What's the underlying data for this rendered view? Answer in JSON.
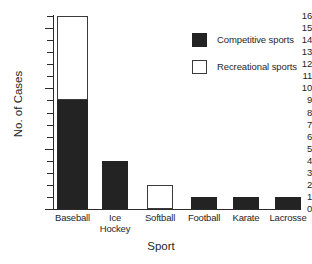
{
  "chart_data": {
    "type": "bar",
    "title": "",
    "xlabel": "Sport",
    "ylabel": "No. of Cases",
    "categories": [
      "Baseball",
      "Ice\nHockey",
      "Softball",
      "Football",
      "Karate",
      "Lacrosse"
    ],
    "series": [
      {
        "name": "Competitive sports",
        "color": "#232323",
        "values": [
          9,
          4,
          0,
          1,
          1,
          1
        ]
      },
      {
        "name": "Recreational sports",
        "color": "#ffffff",
        "values": [
          7,
          0,
          2,
          0,
          0,
          0
        ]
      }
    ],
    "totals": [
      16,
      4,
      2,
      1,
      1,
      1
    ],
    "stacked": true,
    "ylim": [
      0,
      16
    ],
    "ytick_values": [
      0,
      1,
      2,
      3,
      4,
      5,
      6,
      7,
      8,
      9,
      10,
      11,
      12,
      13,
      14,
      15,
      16
    ],
    "ytick_labels": [
      "0",
      "1",
      "2",
      "3",
      "4",
      "5",
      "6",
      "7",
      "8",
      "9",
      "10",
      "11",
      "12",
      "13",
      "14",
      "15",
      "16"
    ],
    "grid": false,
    "legend_position": "upper-right",
    "legend_entries": [
      {
        "label": "Competitive sports",
        "swatch": "filled-black"
      },
      {
        "label": "Recreational sports",
        "swatch": "open-white"
      }
    ]
  },
  "axes": {
    "y_title": "No. of Cases",
    "x_title": "Sport"
  },
  "legend": {
    "items": [
      {
        "label": "Competitive sports"
      },
      {
        "label": "Recreational sports"
      }
    ]
  }
}
